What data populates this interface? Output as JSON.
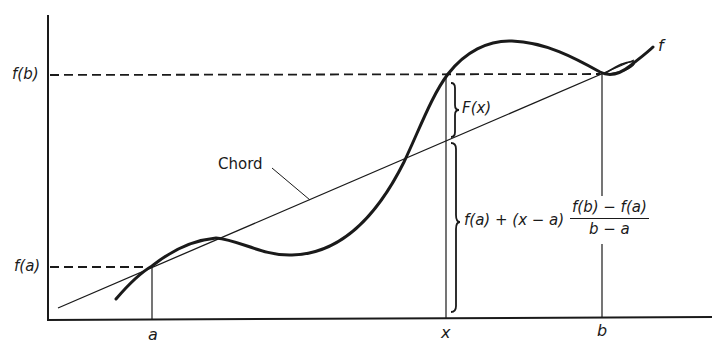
{
  "diagram": {
    "title": "",
    "colors": {
      "ink": "#1a1a1a",
      "background": "#ffffff"
    },
    "x_axis": {
      "ticks": [
        {
          "label": "a",
          "x": 152
        },
        {
          "label": "x",
          "x": 446
        },
        {
          "label": "b",
          "x": 602
        }
      ]
    },
    "y_axis": {
      "ticks": [
        {
          "label": "f(b)",
          "y": 75
        },
        {
          "label": "f(a)",
          "y": 267
        }
      ]
    },
    "curve_label": "f",
    "chord_label": "Chord",
    "brace_upper_label": "F(x)",
    "brace_lower_label": {
      "prefix": "f(a) + (x − a)",
      "numerator": "f(b) − f(a)",
      "denominator": "b − a"
    }
  }
}
